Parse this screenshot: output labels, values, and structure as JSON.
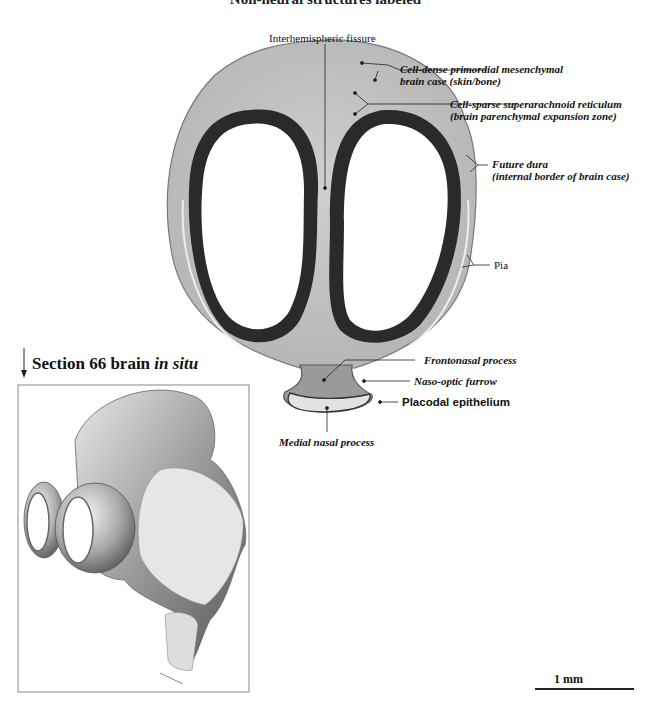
{
  "figure": {
    "clipped_title": "Non-neural structures labeled",
    "labels": {
      "interhemispheric_fissure": "Interhemispheric fissure",
      "cell_dense_line1": "Cell-dense primordial mesenchymal",
      "cell_dense_line2": "brain case (skin/bone)",
      "cell_sparse_line1": "Cell-sparse superarachnoid reticulum",
      "cell_sparse_line2": "(brain parenchymal expansion zone)",
      "future_dura_line1": "Future dura",
      "future_dura_line2": "(internal border of brain case)",
      "pia": "Pia",
      "frontonasal_process": "Frontonasal process",
      "naso_optic_furrow": "Naso-optic furrow",
      "placodal_epithelium": "Placodal epithelium",
      "medial_nasal_process": "Medial nasal process"
    },
    "inset": {
      "heading_prefix": "Section 66 brain ",
      "heading_italic": "in situ"
    },
    "scale_bar": {
      "label": "1 mm"
    }
  }
}
